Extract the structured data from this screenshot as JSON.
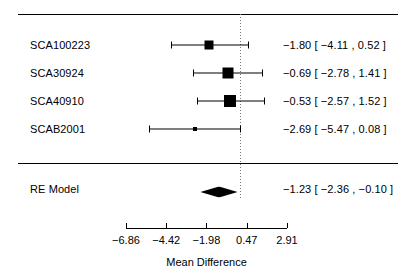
{
  "chart_data": {
    "type": "forest",
    "title": "",
    "xlabel": "Mean Difference",
    "ylabel": "",
    "xlim": [
      -6.86,
      2.91
    ],
    "xticks": [
      -6.86,
      -4.42,
      -1.98,
      0.47,
      2.91
    ],
    "xtick_labels": [
      "−6.86",
      "−4.42",
      "−1.98",
      "0.47",
      "2.91"
    ],
    "reference_line": 0,
    "grid": false,
    "legend": "none",
    "studies": [
      {
        "label": "SCA100223",
        "estimate": -1.8,
        "ci_lower": -4.11,
        "ci_upper": 0.52,
        "annotation": "−1.80 [ −4.11 ,  0.52 ]",
        "weight": 0.24
      },
      {
        "label": "SCA30924",
        "estimate": -0.69,
        "ci_lower": -2.78,
        "ci_upper": 1.41,
        "annotation": "−0.69 [ −2.78 ,  1.41 ]",
        "weight": 0.31
      },
      {
        "label": "SCA40910",
        "estimate": -0.53,
        "ci_lower": -2.57,
        "ci_upper": 1.52,
        "annotation": "−0.53 [ −2.57 ,  1.52 ]",
        "weight": 0.33
      },
      {
        "label": "SCAB2001",
        "estimate": -2.69,
        "ci_lower": -5.47,
        "ci_upper": 0.08,
        "annotation": "−2.69 [ −5.47 ,  0.08 ]",
        "weight": 0.12
      }
    ],
    "summary": {
      "label": "RE Model",
      "estimate": -1.23,
      "ci_lower": -2.36,
      "ci_upper": -0.1,
      "annotation": "−1.23 [ −2.36 , −0.10 ]"
    }
  }
}
